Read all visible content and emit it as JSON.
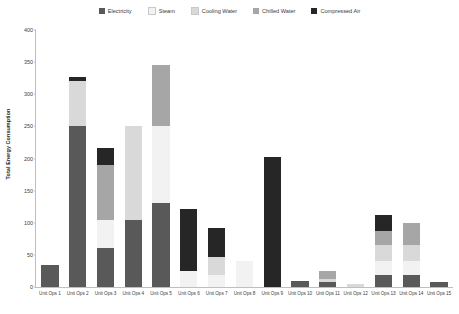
{
  "chart_data": {
    "type": "bar",
    "stacked": true,
    "title": "",
    "xlabel": "",
    "ylabel": "Total Energy Consumption",
    "ylim": [
      0,
      400
    ],
    "yticks": [
      0,
      50,
      100,
      150,
      200,
      250,
      300,
      350,
      400
    ],
    "grid": false,
    "legend_position": "top",
    "categories": [
      "Unit Ops 1",
      "Unit Ops 2",
      "Unit Ops 3",
      "Unit Ops 4",
      "Unit Ops 5",
      "Unit Ops 6",
      "Unit Ops 7",
      "Unit Ops 8",
      "Unit Ops 9",
      "Unit Ops 10",
      "Unit Ops 11",
      "Unit Ops 12",
      "Unit Ops 13",
      "Unit Ops 14",
      "Unit Ops 15"
    ],
    "series": [
      {
        "name": "Electricity",
        "color": "#595959",
        "values": [
          35,
          250,
          60,
          105,
          130,
          0,
          0,
          0,
          0,
          10,
          8,
          0,
          18,
          18,
          8
        ]
      },
      {
        "name": "Steam",
        "color": "#F2F2F2",
        "values": [
          0,
          0,
          45,
          0,
          120,
          25,
          18,
          40,
          0,
          0,
          0,
          0,
          22,
          22,
          0
        ]
      },
      {
        "name": "Cooling Water",
        "color": "#D9D9D9",
        "values": [
          0,
          70,
          0,
          145,
          0,
          0,
          28,
          0,
          0,
          0,
          5,
          5,
          25,
          25,
          0
        ]
      },
      {
        "name": "Chilled Water",
        "color": "#A6A6A6",
        "values": [
          0,
          0,
          85,
          0,
          95,
          0,
          0,
          0,
          0,
          0,
          12,
          0,
          22,
          34,
          0
        ]
      },
      {
        "name": "Compressed Air",
        "color": "#262626",
        "values": [
          0,
          7,
          27,
          0,
          0,
          97,
          46,
          0,
          203,
          0,
          0,
          0,
          25,
          0,
          0
        ]
      }
    ]
  },
  "legend": {
    "items": [
      {
        "label": "Electricity",
        "color": "#595959"
      },
      {
        "label": "Steam",
        "color": "#F2F2F2"
      },
      {
        "label": "Cooling Water",
        "color": "#D9D9D9"
      },
      {
        "label": "Chilled Water",
        "color": "#A6A6A6"
      },
      {
        "label": "Compressed Air",
        "color": "#262626"
      }
    ]
  }
}
